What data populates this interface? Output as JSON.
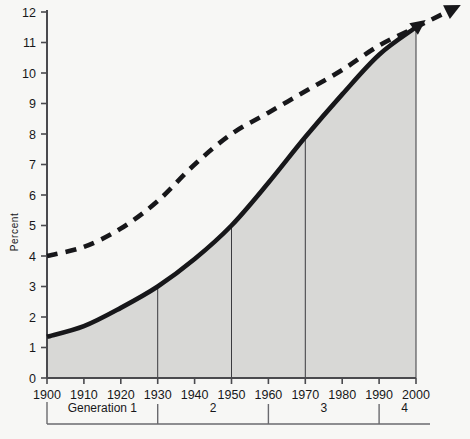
{
  "figure": {
    "background_color": "#f7f7f5",
    "ink_color": "#17171a",
    "fill_color": "#d8d8d6"
  },
  "axes": {
    "y_title": "Percent",
    "y_ticks": [
      "0",
      "1",
      "2",
      "3",
      "4",
      "5",
      "6",
      "7",
      "8",
      "9",
      "10",
      "11",
      "12"
    ],
    "x_ticks": [
      "1900",
      "1910",
      "1920",
      "1930",
      "1940",
      "1950",
      "1960",
      "1970",
      "1980",
      "1990",
      "2000"
    ]
  },
  "generations": {
    "prefix_label": "Generation 1",
    "labels": [
      "Generation 1",
      "2",
      "3",
      "4"
    ]
  },
  "chart_data": {
    "type": "line",
    "title": "",
    "xlabel": "",
    "ylabel": "Percent",
    "xlim": [
      1900,
      2000
    ],
    "ylim": [
      0,
      12
    ],
    "grid": false,
    "legend": "none",
    "x": [
      1900,
      1910,
      1920,
      1930,
      1940,
      1950,
      1960,
      1970,
      1980,
      1990,
      2000
    ],
    "series": [
      {
        "name": "solid-curve",
        "style": "solid",
        "filled": true,
        "arrow_end": true,
        "values": [
          1.35,
          1.7,
          2.3,
          3.0,
          3.9,
          5.0,
          6.4,
          7.9,
          9.3,
          10.6,
          11.5
        ]
      },
      {
        "name": "dashed-curve",
        "style": "dashed",
        "filled": false,
        "arrow_end": true,
        "values": [
          4.0,
          4.3,
          4.9,
          5.8,
          7.0,
          8.0,
          8.7,
          9.4,
          10.1,
          10.9,
          11.5
        ]
      }
    ],
    "drop_lines": [
      {
        "x": 1930,
        "y": 3.0
      },
      {
        "x": 1950,
        "y": 5.0
      },
      {
        "x": 1970,
        "y": 7.9
      },
      {
        "x": 2000,
        "y": 11.5
      }
    ],
    "generation_bands": [
      {
        "label": "Generation 1",
        "start": 1900,
        "end": 1930
      },
      {
        "label": "2",
        "start": 1930,
        "end": 1960
      },
      {
        "label": "3",
        "start": 1960,
        "end": 1990
      },
      {
        "label": "4",
        "start": 1990,
        "end": 2000
      }
    ],
    "annotations": [
      "Solid curve shaded beneath; both curves terminate in arrowheads at the right, the dashed curve extending past the 2000 axis."
    ]
  }
}
